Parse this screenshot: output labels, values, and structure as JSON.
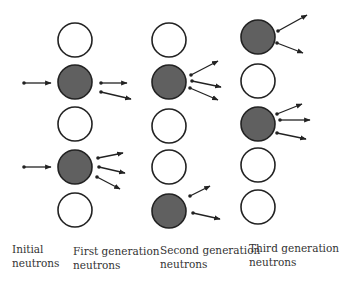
{
  "diagram": {
    "colors": {
      "filled": "#606060",
      "stroke": "#222222",
      "empty": "#ffffff",
      "arrow": "#222222"
    },
    "columns": [
      {
        "id": "first-generation",
        "cx": 75,
        "circles": [
          {
            "cy": 40,
            "filled": false
          },
          {
            "cy": 82,
            "filled": true
          },
          {
            "cy": 124,
            "filled": false
          },
          {
            "cy": 167,
            "filled": true
          },
          {
            "cy": 210,
            "filled": false
          }
        ]
      },
      {
        "id": "second-generation",
        "cx": 169,
        "circles": [
          {
            "cy": 40,
            "filled": false
          },
          {
            "cy": 82,
            "filled": true
          },
          {
            "cy": 126,
            "filled": false
          },
          {
            "cy": 167,
            "filled": false
          },
          {
            "cy": 211,
            "filled": true
          }
        ]
      },
      {
        "id": "third-generation",
        "cx": 258,
        "circles": [
          {
            "cy": 37,
            "filled": true
          },
          {
            "cy": 81,
            "filled": false
          },
          {
            "cy": 124,
            "filled": true
          },
          {
            "cy": 165,
            "filled": false
          },
          {
            "cy": 207,
            "filled": false
          }
        ]
      }
    ],
    "radius": 17,
    "arrows": [
      {
        "from": [
          24,
          83
        ],
        "to": [
          51,
          83
        ],
        "group": "initial"
      },
      {
        "from": [
          24,
          167
        ],
        "to": [
          51,
          167
        ],
        "group": "initial"
      },
      {
        "from": [
          101,
          83
        ],
        "to": [
          127,
          83
        ],
        "group": "first"
      },
      {
        "from": [
          101,
          92
        ],
        "to": [
          131,
          99
        ],
        "group": "first"
      },
      {
        "from": [
          98,
          158
        ],
        "to": [
          123,
          153
        ],
        "group": "first"
      },
      {
        "from": [
          99,
          167
        ],
        "to": [
          125,
          173
        ],
        "group": "first"
      },
      {
        "from": [
          97,
          177
        ],
        "to": [
          120,
          189
        ],
        "group": "first"
      },
      {
        "from": [
          191,
          75
        ],
        "to": [
          218,
          61
        ],
        "group": "second"
      },
      {
        "from": [
          192,
          81
        ],
        "to": [
          221,
          87
        ],
        "group": "second"
      },
      {
        "from": [
          190,
          88
        ],
        "to": [
          218,
          100
        ],
        "group": "second"
      },
      {
        "from": [
          190,
          196
        ],
        "to": [
          210,
          186
        ],
        "group": "second"
      },
      {
        "from": [
          193,
          213
        ],
        "to": [
          220,
          219
        ],
        "group": "second"
      },
      {
        "from": [
          278,
          31
        ],
        "to": [
          307,
          15
        ],
        "group": "third"
      },
      {
        "from": [
          277,
          43
        ],
        "to": [
          303,
          53
        ],
        "group": "third"
      },
      {
        "from": [
          277,
          114
        ],
        "to": [
          302,
          104
        ],
        "group": "third"
      },
      {
        "from": [
          280,
          120
        ],
        "to": [
          310,
          120
        ],
        "group": "third"
      },
      {
        "from": [
          277,
          133
        ],
        "to": [
          306,
          139
        ],
        "group": "third"
      }
    ],
    "labels": {
      "initial": {
        "line1": "Initial",
        "line2": "neutrons",
        "x": 12,
        "y": 242
      },
      "first": {
        "line1": "First generation",
        "line2": "neutrons",
        "x": 73,
        "y": 244
      },
      "second": {
        "line1": "Second generation",
        "line2": "neutrons",
        "x": 160,
        "y": 243
      },
      "third": {
        "line1": "Third generation",
        "line2": "neutrons",
        "x": 249,
        "y": 241
      }
    }
  }
}
